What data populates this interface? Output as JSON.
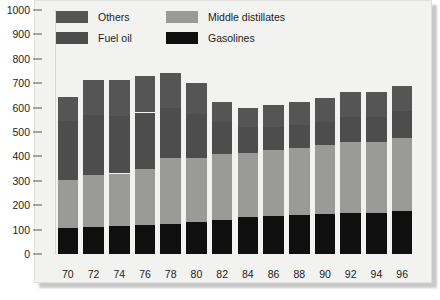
{
  "chart_data": {
    "type": "bar",
    "subtype": "stacked-vertical",
    "title": "",
    "subtitle": "",
    "xlabel": "",
    "ylabel": "",
    "categories": [
      "70",
      "72",
      "74",
      "76",
      "78",
      "80",
      "82",
      "84",
      "86",
      "88",
      "90",
      "92",
      "94",
      "96"
    ],
    "ylim": [
      0,
      1000
    ],
    "y_ticks": [
      0,
      100,
      200,
      300,
      400,
      500,
      600,
      700,
      800,
      900,
      1000
    ],
    "y_tick_labels": [
      "0",
      "100",
      "200",
      "300",
      "400",
      "500",
      "600",
      "700",
      "800",
      "900",
      "1000"
    ],
    "grid": false,
    "legend_position": "top-inside",
    "stack_order_bottom_to_top": [
      "Gasolines",
      "Middle distillates",
      "Fuel oil",
      "Others"
    ],
    "series": [
      {
        "name": "Gasolines",
        "color": "#100f10",
        "values": [
          105,
          110,
          115,
          120,
          125,
          130,
          140,
          150,
          155,
          160,
          165,
          170,
          170,
          175
        ]
      },
      {
        "name": "Middle distillates",
        "color": "#9a9a98",
        "values": [
          200,
          215,
          215,
          230,
          270,
          265,
          270,
          265,
          270,
          275,
          280,
          290,
          290,
          300
        ]
      },
      {
        "name": "Fuel oil",
        "color": "#4d4d4d",
        "values": [
          240,
          245,
          235,
          230,
          205,
          180,
          130,
          105,
          95,
          95,
          95,
          100,
          100,
          110
        ]
      },
      {
        "name": "Others",
        "color": "#555555",
        "values": [
          100,
          145,
          150,
          150,
          140,
          125,
          85,
          80,
          90,
          95,
          100,
          105,
          105,
          105
        ]
      }
    ],
    "bar_totals": [
      645,
      715,
      715,
      730,
      740,
      700,
      625,
      600,
      610,
      625,
      640,
      665,
      665,
      690
    ]
  },
  "legend": {
    "items": [
      {
        "label": "Others",
        "color": "#555555",
        "row": 0,
        "col": 0
      },
      {
        "label": "Middle distillates",
        "color": "#9a9a98",
        "row": 0,
        "col": 1
      },
      {
        "label": "Fuel oil",
        "color": "#4d4d4d",
        "row": 1,
        "col": 0
      },
      {
        "label": "Gasolines",
        "color": "#100f10",
        "row": 1,
        "col": 1
      }
    ]
  },
  "style": {
    "panel_background": "#f2f2f1",
    "page_background": "#ffffff",
    "tick_color": "#555555",
    "text_color": "#222222"
  }
}
